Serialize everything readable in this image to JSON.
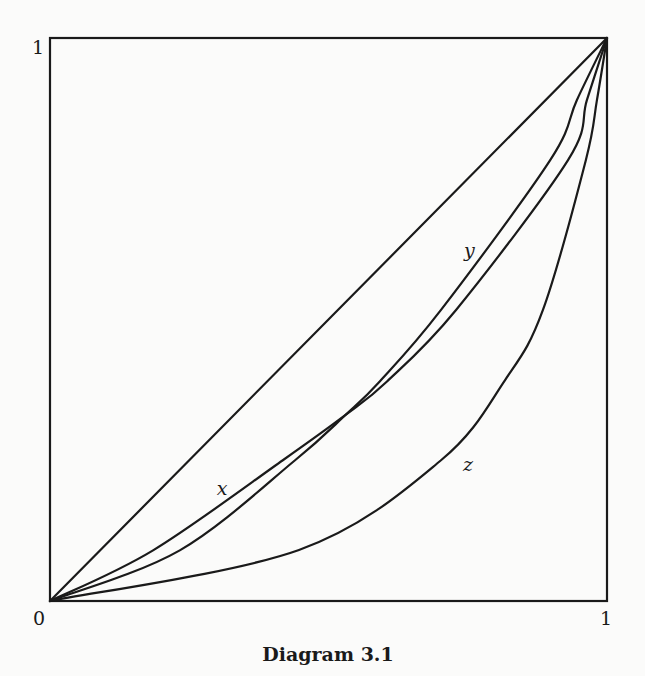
{
  "caption": "Diagram 3.1",
  "axes": {
    "x_min_label": "0",
    "x_max_label": "1",
    "y_max_label": "1",
    "range": [
      0,
      1
    ]
  },
  "colors": {
    "ink": "#1a1a1a",
    "paper": "#fbfbfa"
  },
  "curves": [
    {
      "id": "diagonal",
      "label": "",
      "points": [
        [
          0,
          0
        ],
        [
          1,
          1
        ]
      ]
    },
    {
      "id": "x",
      "label": "x",
      "label_pos": [
        0.31,
        0.197
      ],
      "points": [
        [
          0,
          0
        ],
        [
          0.185,
          0.09
        ],
        [
          0.418,
          0.25
        ],
        [
          0.53,
          0.33
        ],
        [
          0.605,
          0.39
        ],
        [
          0.729,
          0.517
        ],
        [
          0.93,
          0.783
        ],
        [
          0.964,
          0.89
        ],
        [
          1,
          1
        ]
      ]
    },
    {
      "id": "y",
      "label": "y",
      "label_pos": [
        0.754,
        0.62
      ],
      "points": [
        [
          0,
          0
        ],
        [
          0.233,
          0.09
        ],
        [
          0.44,
          0.25
        ],
        [
          0.53,
          0.33
        ],
        [
          0.592,
          0.39
        ],
        [
          0.702,
          0.517
        ],
        [
          0.898,
          0.783
        ],
        [
          0.946,
          0.89
        ],
        [
          1,
          1
        ]
      ]
    },
    {
      "id": "z",
      "label": "z",
      "label_pos": [
        0.752,
        0.24
      ],
      "points": [
        [
          0,
          0
        ],
        [
          0.447,
          0.0906
        ],
        [
          0.702,
          0.25
        ],
        [
          0.817,
          0.3925
        ],
        [
          0.885,
          0.517
        ],
        [
          0.962,
          0.783
        ],
        [
          0.982,
          0.89
        ],
        [
          1,
          1
        ]
      ]
    }
  ]
}
